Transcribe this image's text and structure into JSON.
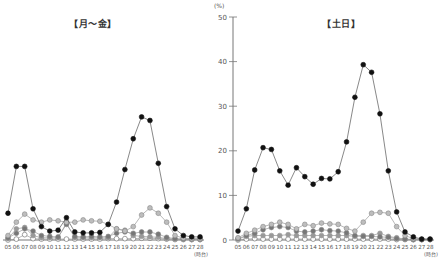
{
  "chart_data": [
    {
      "type": "line",
      "title": "【月～金】",
      "xlabel": "(時台)",
      "ylabel": "(%)",
      "ylim": [
        0,
        50
      ],
      "yticks": [
        0,
        10,
        20,
        30,
        40,
        50
      ],
      "grid": false,
      "categories": [
        "05",
        "06",
        "07",
        "08",
        "09",
        "10",
        "11",
        "12",
        "13",
        "14",
        "15",
        "16",
        "17",
        "18",
        "19",
        "20",
        "21",
        "22",
        "23",
        "24",
        "25",
        "26",
        "27",
        "28"
      ],
      "series": [
        {
          "name": "series-black",
          "color": "#111111",
          "stroke": "#111111",
          "values": [
            6,
            16.5,
            16.5,
            7,
            3,
            2,
            2.2,
            5,
            1.8,
            1.6,
            1.6,
            1.7,
            3.5,
            8.5,
            15.8,
            22.7,
            27.6,
            26.8,
            17.2,
            7.5,
            2.5,
            1,
            0.7,
            0.7
          ]
        },
        {
          "name": "series-light-gray",
          "color": "#bdbdbd",
          "stroke": "#888888",
          "values": [
            1,
            4,
            5.8,
            4.5,
            4,
            4.5,
            4.3,
            4,
            4,
            4.5,
            4.3,
            4.2,
            3.5,
            2.5,
            2,
            3,
            5.6,
            7.2,
            6,
            4,
            1,
            0.4,
            0.3,
            0.3
          ]
        },
        {
          "name": "series-dark-gray",
          "color": "#777777",
          "stroke": "#888888",
          "values": [
            0.5,
            1.5,
            2.5,
            2,
            1,
            0.8,
            0.7,
            3.5,
            0.8,
            0.7,
            0.8,
            0.7,
            0.8,
            1.5,
            1.8,
            1.5,
            1.8,
            1.8,
            1.3,
            0.6,
            0.3,
            0.2,
            0.2,
            0.2
          ]
        },
        {
          "name": "series-mid-gray",
          "color": "#999999",
          "stroke": "#999999",
          "values": [
            0.3,
            2.5,
            2.8,
            1,
            0.5,
            0.5,
            0.5,
            3.8,
            0.5,
            0.5,
            0.5,
            0.5,
            0.5,
            2.5,
            2.2,
            1,
            0.8,
            0.7,
            0.6,
            0.3,
            0.2,
            0.2,
            0.1,
            0.1
          ]
        },
        {
          "name": "series-white",
          "color": "#ffffff",
          "stroke": "#666666",
          "values": [
            0,
            0.2,
            1.2,
            0.3,
            0.2,
            0.2,
            0.2,
            0.2,
            0.2,
            0.2,
            0.2,
            0.2,
            0.3,
            0.3,
            0.3,
            0.3,
            0.4,
            0.4,
            0.3,
            0.2,
            0.1,
            0.1,
            0.1,
            0.1
          ]
        }
      ]
    },
    {
      "type": "line",
      "title": "【土日】",
      "xlabel": "(時台)",
      "ylabel": "(%)",
      "ylim": [
        0,
        50
      ],
      "yticks": [
        0,
        10,
        20,
        30,
        40,
        50
      ],
      "grid": false,
      "categories": [
        "05",
        "06",
        "07",
        "08",
        "09",
        "10",
        "11",
        "12",
        "13",
        "14",
        "15",
        "16",
        "17",
        "18",
        "19",
        "20",
        "21",
        "22",
        "23",
        "24",
        "25",
        "26",
        "27",
        "28"
      ],
      "series": [
        {
          "name": "series-black",
          "color": "#111111",
          "stroke": "#111111",
          "values": [
            2,
            7,
            15.7,
            20.7,
            20.3,
            15.5,
            12.3,
            16.2,
            14.2,
            12.5,
            13.8,
            13.7,
            15.3,
            22,
            32,
            39.3,
            37.6,
            28.3,
            15.5,
            6.3,
            1.8,
            0.7,
            0.2,
            0.2
          ]
        },
        {
          "name": "series-light-gray",
          "color": "#bdbdbd",
          "stroke": "#888888",
          "values": [
            0.5,
            1.5,
            2.2,
            3,
            3.5,
            4,
            3.5,
            2.5,
            3.5,
            3.2,
            3.8,
            3.6,
            3.5,
            2.6,
            2,
            4,
            6,
            6.2,
            6,
            3,
            1,
            0.3,
            0.2,
            0.2
          ]
        },
        {
          "name": "series-dark-gray",
          "color": "#777777",
          "stroke": "#888888",
          "values": [
            0.3,
            1,
            1.5,
            2.3,
            2.8,
            3,
            2.8,
            2,
            1.8,
            2,
            2.3,
            2.1,
            2,
            1.6,
            1,
            0.8,
            0.8,
            0.7,
            0.6,
            0.3,
            0.2,
            0.1,
            0.1,
            0.1
          ]
        },
        {
          "name": "series-mid-gray",
          "color": "#999999",
          "stroke": "#999999",
          "values": [
            0.2,
            0.8,
            1,
            1,
            1,
            1,
            1.2,
            1,
            1,
            1,
            1,
            1,
            1,
            1,
            0.8,
            1,
            1,
            1.5,
            0.8,
            0.5,
            0.2,
            0.1,
            0.1,
            0.1
          ]
        },
        {
          "name": "series-white",
          "color": "#ffffff",
          "stroke": "#666666",
          "values": [
            0,
            0.2,
            0.3,
            0.2,
            0.2,
            0.2,
            0.2,
            0.2,
            0.2,
            0.2,
            0.2,
            0.2,
            0.2,
            0.2,
            0.2,
            0.2,
            0.2,
            0.2,
            0.2,
            0.1,
            0.1,
            0.1,
            0.1,
            0.1
          ]
        }
      ]
    }
  ],
  "panels": {
    "left_title": "【月～金】",
    "right_title": "【土日】",
    "y_unit": "(%)",
    "x_unit": "(時台)"
  }
}
